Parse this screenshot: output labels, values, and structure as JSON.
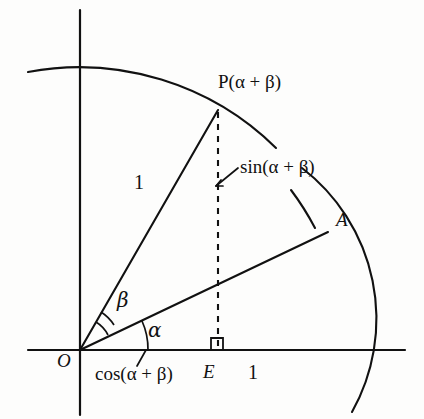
{
  "figure": {
    "background_color": "#fdfdfc",
    "stroke_color": "#111111"
  },
  "labels": {
    "point_p": "P(α + β)",
    "sin_label": "sin(α + β)",
    "point_a": "A",
    "radius_one_op": "1",
    "angle_beta": "β",
    "angle_alpha": "α",
    "origin": "O",
    "cos_label": "cos(α + β)",
    "foot_e": "E",
    "radius_one_base": "1"
  },
  "geometry": {
    "origin": {
      "x": 80,
      "y": 350
    },
    "x_axis": {
      "x1": 28,
      "y1": 350,
      "x2": 405,
      "y2": 350
    },
    "y_axis": {
      "x1": 80,
      "y1": 10,
      "x2": 80,
      "y2": 415
    },
    "inner_arc_radius": 280,
    "outer_arc_radius": 275,
    "point_p": {
      "x": 218,
      "y": 110
    },
    "point_a": {
      "x": 326,
      "y": 233
    },
    "point_e": {
      "x": 218,
      "y": 350
    },
    "angle_alpha_degrees": 25.5,
    "angle_alpha_plus_beta_degrees": 60,
    "beta_arc_radii": [
      28,
      38
    ],
    "alpha_arc_radius": 56,
    "right_angle_marker_size": 11
  },
  "icons": {
    "right_angle": "right-angle-marker",
    "leader_sin": "leader-line-sin",
    "leader_cos": "leader-line-cos"
  }
}
